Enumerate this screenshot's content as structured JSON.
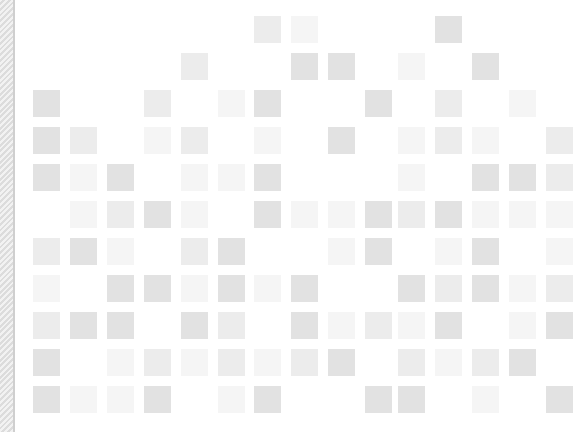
{
  "layout": {
    "columns_x": [
      33,
      70,
      107,
      144,
      181,
      218,
      254,
      291,
      328,
      365,
      398,
      435,
      472,
      509,
      546
    ],
    "rows_y": [
      16,
      53,
      90,
      127,
      164,
      201,
      238,
      275,
      312,
      349,
      386
    ],
    "square_size": 27,
    "levels": {
      "1": "#f5f5f5",
      "2": "#ececec",
      "3": "#e2e2e2"
    }
  },
  "grid": [
    [
      0,
      0,
      0,
      0,
      0,
      0,
      2,
      1,
      0,
      0,
      0,
      3,
      0,
      0,
      0
    ],
    [
      0,
      0,
      0,
      0,
      2,
      0,
      0,
      3,
      3,
      0,
      1,
      0,
      3,
      0,
      0
    ],
    [
      3,
      0,
      0,
      2,
      0,
      1,
      3,
      0,
      0,
      3,
      0,
      2,
      0,
      1,
      0
    ],
    [
      3,
      2,
      0,
      1,
      2,
      0,
      1,
      0,
      3,
      0,
      1,
      2,
      1,
      0,
      2
    ],
    [
      3,
      1,
      3,
      0,
      1,
      1,
      3,
      0,
      0,
      0,
      1,
      0,
      3,
      3,
      2
    ],
    [
      0,
      1,
      2,
      3,
      1,
      0,
      3,
      1,
      1,
      3,
      2,
      3,
      1,
      1,
      1
    ],
    [
      2,
      3,
      1,
      0,
      2,
      3,
      0,
      0,
      1,
      3,
      0,
      1,
      3,
      0,
      1
    ],
    [
      1,
      0,
      3,
      3,
      1,
      3,
      1,
      3,
      0,
      0,
      3,
      2,
      3,
      1,
      2
    ],
    [
      2,
      3,
      3,
      0,
      3,
      2,
      0,
      3,
      1,
      2,
      1,
      3,
      0,
      1,
      3
    ],
    [
      3,
      0,
      1,
      2,
      1,
      2,
      1,
      2,
      3,
      0,
      2,
      1,
      2,
      3,
      0
    ],
    [
      3,
      1,
      1,
      3,
      0,
      1,
      3,
      0,
      0,
      3,
      3,
      0,
      1,
      0,
      3
    ]
  ]
}
